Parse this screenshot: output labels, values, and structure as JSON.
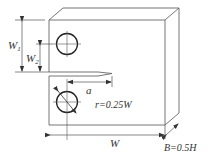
{
  "diagram": {
    "type": "compact tension specimen drawing",
    "labels": {
      "w1_main": "W",
      "w1_sub": "1",
      "w2_main": "W",
      "w2_sub": "2",
      "a": "a",
      "radius": "r=0.25W",
      "width": "W",
      "thickness": "B=0.5H"
    },
    "colors": {
      "line": "#666666",
      "hole": "#222222",
      "text": "#333333"
    }
  }
}
